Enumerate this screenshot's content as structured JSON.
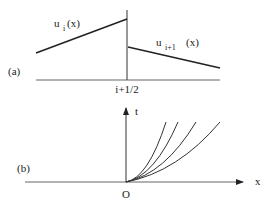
{
  "figure": {
    "panel_a": {
      "label": "(a)",
      "interface_label": "i+1/2",
      "left_function": {
        "base": "u",
        "subscript": "i",
        "arg": "(x)"
      },
      "right_function": {
        "base": "u",
        "subscript": "i+1",
        "arg": "(x)"
      }
    },
    "panel_b": {
      "label": "(b)",
      "origin_label": "O",
      "x_axis_label": "x",
      "t_axis_label": "t",
      "curve_count": 4
    }
  }
}
